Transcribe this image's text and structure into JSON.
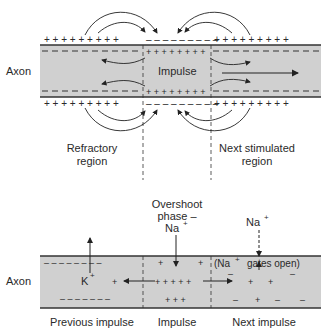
{
  "diagram": {
    "top": {
      "axon_label": "Axon",
      "impulse_label": "Impulse",
      "left_region_line1": "Refractory",
      "left_region_line2": "region",
      "right_region_line1": "Next stimulated",
      "right_region_line2": "region",
      "plus": "+ + + + + + + + +",
      "colors": {
        "axon_fill": "#d0d0d0",
        "line": "#333333"
      }
    },
    "bottom": {
      "axon_label": "Axon",
      "overshoot_line1": "Overshoot",
      "overshoot_line2": "phase  –",
      "overshoot_ion": "Na",
      "na_right": "Na",
      "k_ion": "K",
      "sup_plus": "+",
      "gates_open_prefix": "(Na",
      "gates_open_suffix": "gates open)",
      "sections": [
        "Previous impulse",
        "Impulse",
        "Next impulse"
      ]
    }
  }
}
